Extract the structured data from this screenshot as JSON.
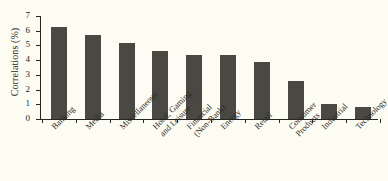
{
  "chart_data": {
    "type": "bar",
    "title": "",
    "xlabel": "",
    "ylabel": "Correlations (%)",
    "ylim": [
      0,
      7
    ],
    "ytick_labels": [
      "0",
      "1",
      "2",
      "3",
      "4",
      "5",
      "6",
      "7"
    ],
    "ytick_values": [
      0,
      1,
      2,
      3,
      4,
      5,
      6,
      7
    ],
    "grid": false,
    "legend": "none",
    "bar_color": "#4a4842",
    "background_color": "#fdfcf3",
    "axis_color": "#26251f",
    "categories": [
      "Banking",
      "Media",
      "Miscellaneous",
      "Hotel, Gaming\nand Leisure",
      "Financial\n(Non-Bank)",
      "Energy",
      "Retail",
      "Consumer\nProducts",
      "Industrial",
      "Technology"
    ],
    "values": [
      6.25,
      5.7,
      5.2,
      4.6,
      4.35,
      4.35,
      3.85,
      2.55,
      1.05,
      0.8
    ]
  }
}
